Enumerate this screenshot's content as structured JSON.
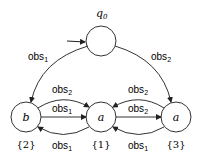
{
  "diagram": {
    "type": "state-transition",
    "states": [
      {
        "id": "q0",
        "label": "q",
        "sub": "0",
        "set": "",
        "initial": true
      },
      {
        "id": "b",
        "label": "b",
        "set": "{2}"
      },
      {
        "id": "a1",
        "label": "a",
        "set": "{1}"
      },
      {
        "id": "a3",
        "label": "a",
        "set": "{3}"
      }
    ],
    "edges": [
      {
        "from": "q0",
        "to": "b",
        "label": "obs",
        "sub": "1"
      },
      {
        "from": "q0",
        "to": "a3",
        "label": "obs",
        "sub": "2"
      },
      {
        "from": "b",
        "to": "a1",
        "label": "obs",
        "sub": "2",
        "style": "curved-top"
      },
      {
        "from": "b",
        "to": "a1",
        "label": "obs",
        "sub": "1",
        "style": "straight"
      },
      {
        "from": "a1",
        "to": "b",
        "label": "obs",
        "sub": "1",
        "style": "curved-bottom"
      },
      {
        "from": "a3",
        "to": "a1",
        "label": "obs",
        "sub": "2",
        "style": "curved-top"
      },
      {
        "from": "a1",
        "to": "a3",
        "label": "obs",
        "sub": "2",
        "style": "straight"
      },
      {
        "from": "a3",
        "to": "a1",
        "label": "obs",
        "sub": "1",
        "style": "curved-bottom"
      }
    ]
  }
}
